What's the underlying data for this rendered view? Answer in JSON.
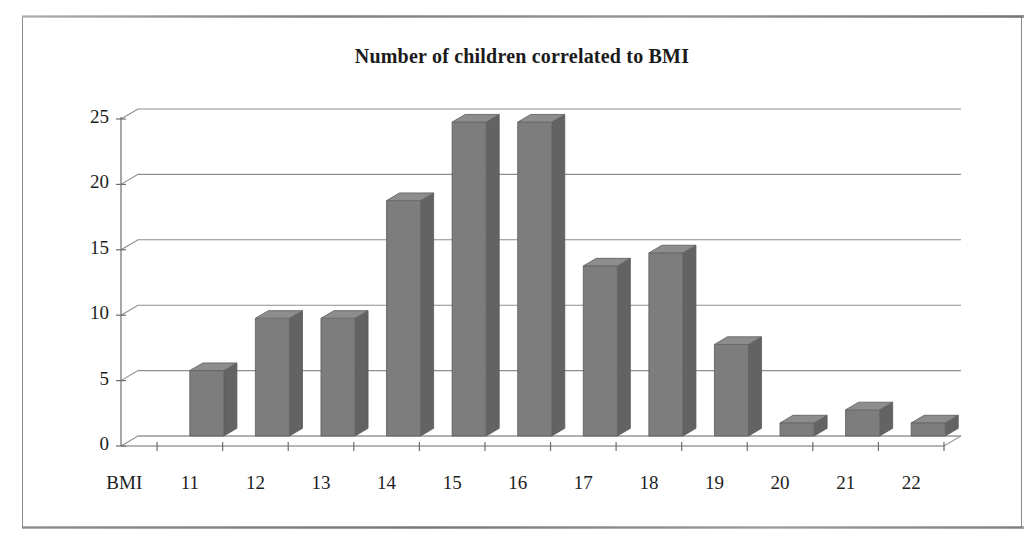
{
  "chart_data": {
    "type": "bar",
    "title": "Number of children correlated to BMI",
    "xlabel": "BMI",
    "ylabel": "",
    "axis_label_prefix": "BMI",
    "categories": [
      "11",
      "12",
      "13",
      "14",
      "15",
      "16",
      "17",
      "18",
      "19",
      "20",
      "21",
      "22"
    ],
    "values": [
      5,
      9,
      9,
      18,
      24,
      24,
      13,
      14,
      7,
      1,
      2,
      1
    ],
    "ytick_labels": [
      "0",
      "5",
      "10",
      "15",
      "20",
      "25"
    ],
    "ytick_values": [
      0,
      5,
      10,
      15,
      20,
      25
    ],
    "ylim": [
      0,
      25
    ],
    "grid": true,
    "legend": false,
    "legend_position": "none",
    "style": "3d-column",
    "bar_color": "#7d7d7d",
    "bar_top_color": "#8d8d8d",
    "bar_side_color": "#636363",
    "gridline_color": "#8e8e8e",
    "background_color": "#ffffff",
    "border_color": "#8a8a8a",
    "text_color": "#1d1d1d"
  }
}
